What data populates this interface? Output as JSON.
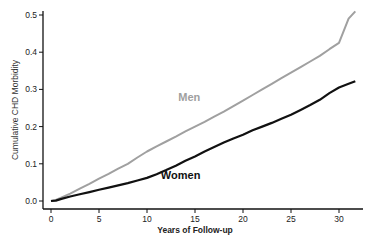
{
  "chart_data": {
    "type": "line",
    "title": "",
    "xlabel": "Years of Follow-up",
    "ylabel": "Cumulative CHD Morbidity",
    "xlim": [
      0,
      32.5
    ],
    "ylim": [
      0,
      0.5
    ],
    "xticks": [
      0,
      5,
      10,
      15,
      20,
      25,
      30
    ],
    "xtick_labels": [
      "0",
      "5",
      "10",
      "15",
      "20",
      "25",
      "30"
    ],
    "yticks": [
      0.0,
      0.1,
      0.2,
      0.3,
      0.4,
      0.5
    ],
    "ytick_labels": [
      "0.0",
      "0.1",
      "0.2",
      "0.3",
      "0.4",
      "0.5"
    ],
    "grid": false,
    "legend": "inline-labels",
    "series": [
      {
        "name": "Men",
        "color": "#a0a0a0",
        "label_position": [
          14.4,
          0.27
        ],
        "x": [
          0,
          0.5,
          1,
          2,
          3,
          4,
          5,
          6,
          7,
          8,
          9,
          10,
          11,
          12,
          13,
          14,
          15,
          16,
          17,
          18,
          19,
          20,
          21,
          22,
          23,
          24,
          25,
          26,
          27,
          28,
          29,
          30,
          31,
          31.7
        ],
        "values": [
          0.0,
          0.003,
          0.008,
          0.02,
          0.033,
          0.046,
          0.06,
          0.073,
          0.087,
          0.1,
          0.117,
          0.133,
          0.147,
          0.16,
          0.173,
          0.187,
          0.2,
          0.213,
          0.227,
          0.24,
          0.255,
          0.27,
          0.285,
          0.3,
          0.315,
          0.33,
          0.345,
          0.36,
          0.375,
          0.39,
          0.408,
          0.425,
          0.49,
          0.51
        ]
      },
      {
        "name": "Women",
        "color": "#111111",
        "label_position": [
          13.5,
          0.06
        ],
        "x": [
          0,
          0.5,
          1,
          2,
          3,
          4,
          5,
          6,
          7,
          8,
          9,
          10,
          11,
          12,
          13,
          14,
          15,
          16,
          17,
          18,
          19,
          20,
          21,
          22,
          23,
          24,
          25,
          26,
          27,
          28,
          29,
          30,
          31,
          31.7
        ],
        "values": [
          0.0,
          0.001,
          0.005,
          0.012,
          0.018,
          0.024,
          0.03,
          0.036,
          0.042,
          0.048,
          0.055,
          0.062,
          0.072,
          0.083,
          0.095,
          0.108,
          0.12,
          0.133,
          0.145,
          0.157,
          0.168,
          0.178,
          0.19,
          0.2,
          0.21,
          0.221,
          0.232,
          0.245,
          0.258,
          0.272,
          0.29,
          0.305,
          0.315,
          0.322
        ]
      }
    ]
  }
}
